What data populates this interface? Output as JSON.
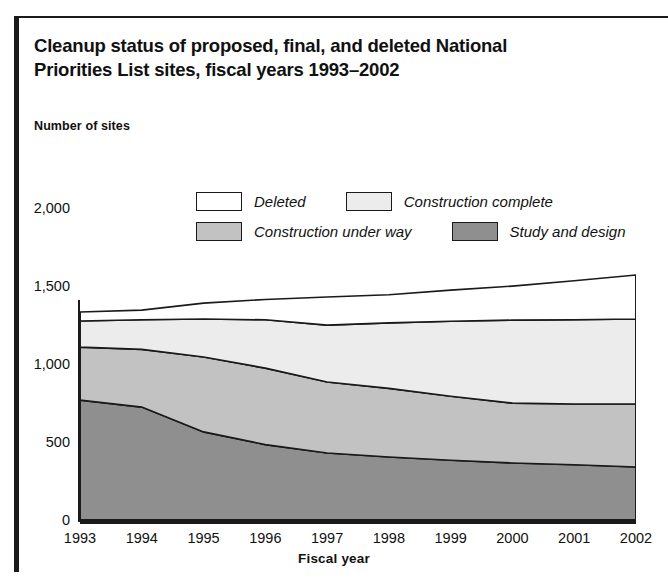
{
  "figure": {
    "title_line1": "Cleanup status of proposed, final, and deleted National",
    "title_line2": "Priorities List sites, fiscal years 1993–2002",
    "axis_note": "Number of sites"
  },
  "legend": {
    "items": [
      {
        "label": "Deleted",
        "color": "#ffffff"
      },
      {
        "label": "Construction complete",
        "color": "#ececec"
      },
      {
        "label": "Construction under way",
        "color": "#c2c2c2"
      },
      {
        "label": "Study and design",
        "color": "#8f8f8f"
      }
    ]
  },
  "chart_data": {
    "type": "area",
    "stacked": true,
    "title": "Cleanup status of proposed, final, and deleted National Priorities List sites, fiscal years 1993–2002",
    "xlabel": "Fiscal year",
    "ylabel": "Number of sites",
    "categories": [
      "1993",
      "1994",
      "1995",
      "1996",
      "1997",
      "1998",
      "1999",
      "2000",
      "2001",
      "2002"
    ],
    "x": [
      1993,
      1994,
      1995,
      1996,
      1997,
      1998,
      1999,
      2000,
      2001,
      2002
    ],
    "ylim": [
      0,
      2000
    ],
    "yticks": [
      0,
      500,
      1000,
      1500,
      2000
    ],
    "ytick_labels": [
      "0",
      "500",
      "1,000",
      "1,500",
      "2,000"
    ],
    "grid": false,
    "legend_position": "top-center",
    "series": [
      {
        "name": "Study and design",
        "color": "#8f8f8f",
        "values": [
          775,
          730,
          571,
          490,
          436,
          410,
          390,
          372,
          360,
          346
        ]
      },
      {
        "name": "Construction under way",
        "color": "#c2c2c2",
        "values": [
          340,
          370,
          480,
          490,
          455,
          440,
          410,
          384,
          390,
          404
        ]
      },
      {
        "name": "Construction complete",
        "color": "#ececec",
        "values": [
          167,
          190,
          244,
          310,
          365,
          420,
          480,
          532,
          540,
          545
        ]
      },
      {
        "name": "Deleted",
        "color": "#ffffff",
        "values": [
          58,
          62,
          102,
          130,
          180,
          180,
          200,
          218,
          250,
          282
        ]
      }
    ],
    "cumulative_totals": [
      1340,
      1352,
      1397,
      1420,
      1436,
      1450,
      1480,
      1506,
      1540,
      1577
    ],
    "cumulative_boundaries": {
      "study_and_design_top": [
        775,
        730,
        571,
        490,
        436,
        410,
        390,
        372,
        360,
        346
      ],
      "construction_under_way_top": [
        1115,
        1100,
        1051,
        980,
        891,
        850,
        800,
        756,
        750,
        750
      ],
      "construction_complete_top": [
        1282,
        1290,
        1295,
        1290,
        1256,
        1270,
        1280,
        1288,
        1290,
        1295
      ],
      "deleted_top": [
        1340,
        1352,
        1397,
        1420,
        1436,
        1450,
        1480,
        1506,
        1540,
        1577
      ]
    }
  }
}
